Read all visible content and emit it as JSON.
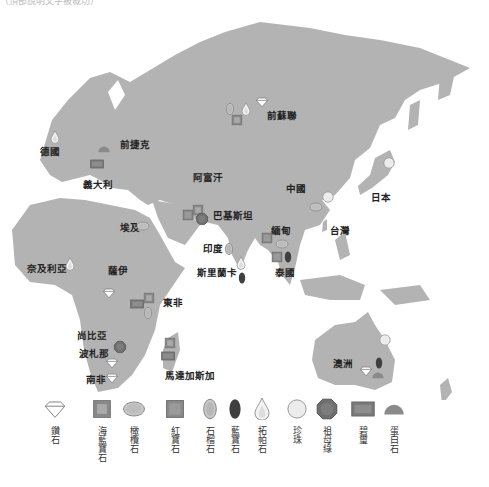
{
  "title_fragment": "（頂部說明文字被裁切）",
  "map": {
    "land_color": "#b3b3b3",
    "countries": [
      {
        "name": "德國",
        "x": 40,
        "y": 146
      },
      {
        "name": "前捷克",
        "x": 120,
        "y": 139
      },
      {
        "name": "義大利",
        "x": 83,
        "y": 179
      },
      {
        "name": "前蘇聯",
        "x": 267,
        "y": 110
      },
      {
        "name": "阿富汗",
        "x": 193,
        "y": 172
      },
      {
        "name": "中國",
        "x": 286,
        "y": 183
      },
      {
        "name": "日本",
        "x": 371,
        "y": 192
      },
      {
        "name": "巴基斯坦",
        "x": 213,
        "y": 210
      },
      {
        "name": "埃及",
        "x": 120,
        "y": 222
      },
      {
        "name": "台灣",
        "x": 330,
        "y": 225
      },
      {
        "name": "緬甸",
        "x": 271,
        "y": 225
      },
      {
        "name": "印度",
        "x": 203,
        "y": 243
      },
      {
        "name": "斯里蘭卡",
        "x": 197,
        "y": 267
      },
      {
        "name": "泰國",
        "x": 275,
        "y": 267
      },
      {
        "name": "奈及利亞",
        "x": 27,
        "y": 263
      },
      {
        "name": "薩伊",
        "x": 108,
        "y": 265
      },
      {
        "name": "東非",
        "x": 163,
        "y": 297
      },
      {
        "name": "尚比亞",
        "x": 77,
        "y": 330
      },
      {
        "name": "波札那",
        "x": 79,
        "y": 348
      },
      {
        "name": "馬達加斯加",
        "x": 165,
        "y": 370
      },
      {
        "name": "南非",
        "x": 86,
        "y": 374
      },
      {
        "name": "澳洲",
        "x": 333,
        "y": 358
      }
    ],
    "markers": [
      {
        "type": "topaz",
        "x": 55,
        "y": 137
      },
      {
        "type": "opal",
        "x": 104,
        "y": 149
      },
      {
        "type": "jade",
        "x": 97,
        "y": 164
      },
      {
        "type": "tourmaline",
        "x": 230,
        "y": 109
      },
      {
        "type": "topaz",
        "x": 246,
        "y": 109
      },
      {
        "type": "aquamarine",
        "x": 237,
        "y": 120
      },
      {
        "type": "diamond",
        "x": 262,
        "y": 102
      },
      {
        "type": "ruby",
        "x": 188,
        "y": 215
      },
      {
        "type": "aquamarine",
        "x": 198,
        "y": 210
      },
      {
        "type": "emerald",
        "x": 202,
        "y": 219
      },
      {
        "type": "tourmaline",
        "x": 229,
        "y": 249
      },
      {
        "type": "topaz",
        "x": 241,
        "y": 263
      },
      {
        "type": "sapphire",
        "x": 242,
        "y": 278
      },
      {
        "type": "pearl",
        "x": 389,
        "y": 163
      },
      {
        "type": "pearl",
        "x": 328,
        "y": 197
      },
      {
        "type": "agate",
        "x": 316,
        "y": 207
      },
      {
        "type": "ruby",
        "x": 267,
        "y": 238
      },
      {
        "type": "agate",
        "x": 282,
        "y": 244
      },
      {
        "type": "ruby",
        "x": 277,
        "y": 257
      },
      {
        "type": "sapphire",
        "x": 288,
        "y": 257
      },
      {
        "type": "agate",
        "x": 143,
        "y": 226
      },
      {
        "type": "topaz",
        "x": 70,
        "y": 264
      },
      {
        "type": "diamond",
        "x": 109,
        "y": 293
      },
      {
        "type": "aquamarine",
        "x": 149,
        "y": 298
      },
      {
        "type": "jade",
        "x": 137,
        "y": 304
      },
      {
        "type": "tourmaline",
        "x": 148,
        "y": 313
      },
      {
        "type": "emerald",
        "x": 120,
        "y": 347
      },
      {
        "type": "aquamarine",
        "x": 170,
        "y": 343
      },
      {
        "type": "jade",
        "x": 168,
        "y": 356
      },
      {
        "type": "diamond",
        "x": 112,
        "y": 363
      },
      {
        "type": "diamond",
        "x": 112,
        "y": 378
      },
      {
        "type": "pearl",
        "x": 385,
        "y": 340
      },
      {
        "type": "sapphire",
        "x": 379,
        "y": 363
      },
      {
        "type": "diamond",
        "x": 366,
        "y": 371
      },
      {
        "type": "opal",
        "x": 378,
        "y": 375
      }
    ]
  },
  "legend": [
    {
      "type": "diamond",
      "label": "鑽石"
    },
    {
      "type": "aquamarine",
      "label": "海藍寶石"
    },
    {
      "type": "agate",
      "label": "橄欖石"
    },
    {
      "type": "ruby",
      "label": "紅寶石"
    },
    {
      "type": "tourmaline",
      "label": "石榴石"
    },
    {
      "type": "sapphire",
      "label": "藍寶石"
    },
    {
      "type": "topaz",
      "label": "拓帕石"
    },
    {
      "type": "pearl",
      "label": "珍珠"
    },
    {
      "type": "emerald",
      "label": "祖母綠"
    },
    {
      "type": "jade",
      "label": "碧璽"
    },
    {
      "type": "opal",
      "label": "蛋白石"
    }
  ],
  "legend_positions": [
    20,
    67,
    99,
    140,
    175,
    200,
    227,
    262,
    292,
    328,
    359
  ]
}
